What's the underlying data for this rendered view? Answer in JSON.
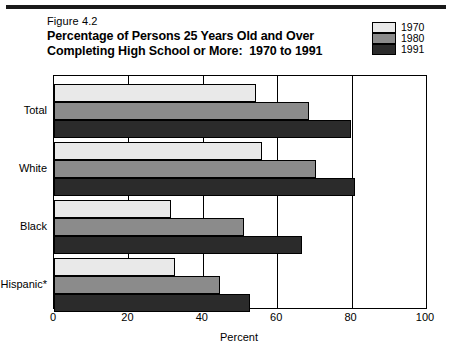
{
  "figure": {
    "number": "Figure 4.2",
    "title_line1": "Percentage of Persons 25 Years Old and Over",
    "title_line2": "Completing High School or More:  1970 to 1991"
  },
  "legend": {
    "items": [
      {
        "label": "1970",
        "color": "#e9e9e9"
      },
      {
        "label": "1980",
        "color": "#8b8b8b"
      },
      {
        "label": "1991",
        "color": "#2b2b2b"
      }
    ]
  },
  "axis": {
    "x_title": "Percent",
    "x_ticks": [
      "0",
      "20",
      "40",
      "60",
      "80",
      "100"
    ],
    "y_categories": [
      "Total",
      "White",
      "Black",
      "Hispanic*"
    ]
  },
  "chart_data": {
    "type": "bar",
    "orientation": "horizontal",
    "title": "Percentage of Persons 25 Years Old and Over Completing High School or More:  1970 to 1991",
    "subtitle": "Figure 4.2",
    "xlabel": "Percent",
    "ylabel": "",
    "xlim": [
      0,
      100
    ],
    "xticks": [
      0,
      20,
      40,
      60,
      80,
      100
    ],
    "grid": true,
    "grid_axis": "x",
    "legend_position": "top-right",
    "categories": [
      "Total",
      "White",
      "Black",
      "Hispanic*"
    ],
    "series": [
      {
        "name": "1970",
        "color": "#e9e9e9",
        "values": [
          54.3,
          55.9,
          31.4,
          32.6
        ]
      },
      {
        "name": "1980",
        "color": "#8b8b8b",
        "values": [
          68.5,
          70.4,
          51.2,
          44.5
        ]
      },
      {
        "name": "1991",
        "color": "#2b2b2b",
        "values": [
          79.9,
          81.0,
          66.7,
          52.6
        ]
      }
    ],
    "footnote": "*Hispanic"
  }
}
